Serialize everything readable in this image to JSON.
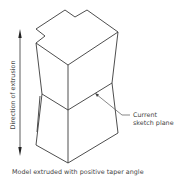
{
  "diagram": {
    "caption": "Model extruded with positive taper angle",
    "axis_label": "Direction of extrusion",
    "callout": {
      "line1": "Current",
      "line2": "sketch plane"
    },
    "colors": {
      "line": "#3a3a3a",
      "text": "#444444",
      "background": "#ffffff"
    }
  }
}
